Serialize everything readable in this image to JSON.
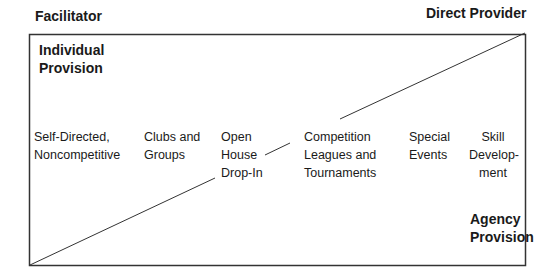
{
  "labels": {
    "facilitator": "Facilitator",
    "direct_provider": "Direct Provider",
    "individual_provision": [
      "Individual",
      "Provision"
    ],
    "agency_provision": [
      "Agency",
      "Provision"
    ]
  },
  "items": [
    {
      "lines": [
        "Self-Directed,",
        "Noncompetitive"
      ]
    },
    {
      "lines": [
        "Clubs and",
        "Groups"
      ]
    },
    {
      "lines": [
        "Open",
        "House",
        "Drop-In"
      ]
    },
    {
      "lines": [
        "Competition",
        "Leagues and",
        "Tournaments"
      ]
    },
    {
      "lines": [
        "Special",
        "Events"
      ]
    },
    {
      "lines": [
        "Skill",
        "Develop-",
        "ment"
      ]
    }
  ],
  "colors": {
    "line": "#333333",
    "text": "#1a1a1a"
  }
}
